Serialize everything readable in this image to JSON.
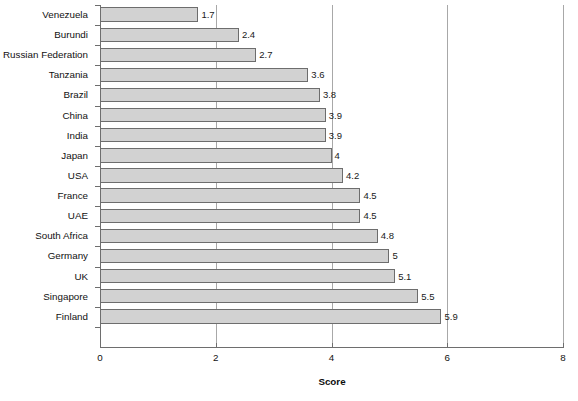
{
  "chart_data": {
    "type": "bar",
    "orientation": "horizontal",
    "title": "",
    "xlabel": "Score",
    "ylabel": "",
    "xlim": [
      0,
      8
    ],
    "xticks": [
      "0",
      "2",
      "4",
      "6",
      "8"
    ],
    "grid": "vertical-only",
    "legend": "none",
    "categories": [
      "Venezuela",
      "Burundi",
      "Russian Federation",
      "Tanzania",
      "Brazil",
      "China",
      "India",
      "Japan",
      "USA",
      "France",
      "UAE",
      "South Africa",
      "Germany",
      "UK",
      "Singapore",
      "Finland"
    ],
    "values": [
      1.7,
      2.4,
      2.7,
      3.6,
      3.8,
      3.9,
      3.9,
      4,
      4.2,
      4.5,
      4.5,
      4.8,
      5,
      5.1,
      5.5,
      5.9
    ],
    "value_labels": [
      "1.7",
      "2.4",
      "2.7",
      "3.6",
      "3.8",
      "3.9",
      "3.9",
      "4",
      "4.2",
      "4.5",
      "4.5",
      "4.8",
      "5",
      "5.1",
      "5.5",
      "5.9"
    ],
    "colors": {
      "bar_fill": "#d2d2d2",
      "bar_border": "#6d6d6d",
      "gridline": "#a8a8a8",
      "axis": "#6e6e6e",
      "text": "#111111",
      "background": "#ffffff"
    }
  }
}
